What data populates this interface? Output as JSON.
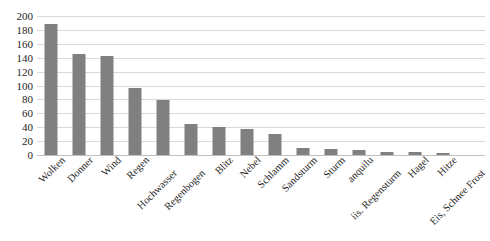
{
  "chart_data": {
    "type": "bar",
    "title": "",
    "subtitle": "",
    "xlabel": "",
    "ylabel": "",
    "ylim": [
      0,
      200
    ],
    "yticks": [
      0,
      20,
      40,
      60,
      80,
      100,
      120,
      140,
      160,
      180,
      200
    ],
    "grid": true,
    "legend": false,
    "legend_position": "none",
    "bar_color": "#808080",
    "gridline_color": "#d9d9d9",
    "categories": [
      "Wolken",
      "Donner",
      "Wind",
      "Regen",
      "Hochwasser",
      "Regenbogen",
      "Blitz",
      "Nebel",
      "Schlamm",
      "Sandsturm",
      "Sturm",
      "anquilu",
      "iis. Regensturm",
      "Hagel",
      "Hitze",
      "Eis, Schnee Frost"
    ],
    "values": [
      188,
      146,
      143,
      96,
      79,
      45,
      41,
      37,
      30,
      10,
      8,
      7,
      4,
      4,
      3,
      0
    ]
  }
}
